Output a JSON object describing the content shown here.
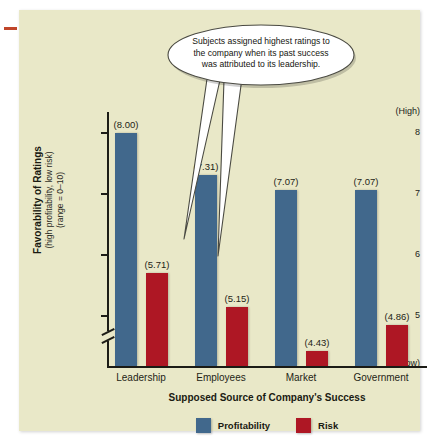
{
  "chart_data": {
    "type": "bar",
    "title": "",
    "xlabel": "Supposed Source of Company's Success",
    "ylabel": "Favorability of Ratings",
    "ylabel_sub1": "(high profitability, low risk)",
    "ylabel_sub2": "(range = 0–10)",
    "categories": [
      "Leadership",
      "Employees",
      "Market",
      "Government"
    ],
    "series": [
      {
        "name": "Profitability",
        "values": [
          8.0,
          7.31,
          7.07,
          7.07
        ],
        "color": "#41688c"
      },
      {
        "name": "Risk",
        "values": [
          5.71,
          5.15,
          4.43,
          4.86
        ],
        "color": "#ae1724"
      }
    ],
    "value_labels": {
      "profitability": [
        "(8.00)",
        "(7.31)",
        "(7.07)",
        "(7.07)"
      ],
      "risk": [
        "(5.71)",
        "(5.15)",
        "(4.43)",
        "(4.86)"
      ]
    },
    "yticks": [
      "8",
      "7",
      "6",
      "5"
    ],
    "ytick_values": [
      8,
      7,
      6,
      5
    ],
    "y_high_label": "(High)",
    "y_low_label": "(Low)",
    "ylim": [
      4.18,
      8.35
    ],
    "axis_break": true,
    "grid": false,
    "legend_position": "bottom"
  },
  "annotation": {
    "callout_line1": "Subjects assigned highest ratings to",
    "callout_line2": "the company when its past success",
    "callout_line3": "was attributed to its leadership."
  },
  "legend": {
    "items": [
      {
        "label": "Profitability",
        "color": "#41688c"
      },
      {
        "label": "Risk",
        "color": "#ae1724"
      }
    ]
  },
  "colors": {
    "panel_background": "#e9e8c8",
    "page_background": "#ffffff",
    "profitability": "#41688c",
    "risk": "#ae1724",
    "axis": "#1c1c16",
    "margin_mark": "#c0452a"
  }
}
